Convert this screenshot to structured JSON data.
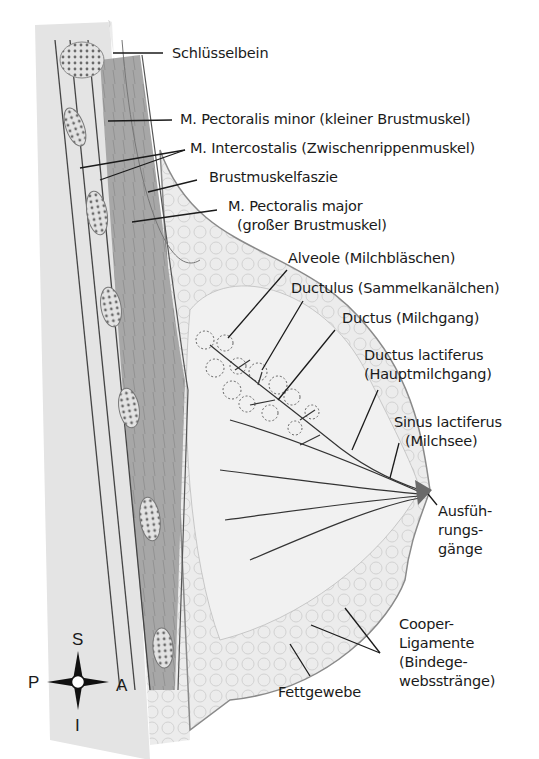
{
  "diagram": {
    "labels": {
      "schluesselbein": "Schlüsselbein",
      "pectoralis_minor": "M. Pectoralis minor (kleiner Brustmuskel)",
      "intercostalis": "M. Intercostalis (Zwischenrippenmuskel)",
      "brustmuskelfaszie": "Brustmuskelfaszie",
      "pectoralis_major_1": "M. Pectoralis major",
      "pectoralis_major_2": "(großer Brustmuskel)",
      "alveole": "Alveole (Milchbläschen)",
      "ductulus": "Ductulus (Sammelkanälchen)",
      "ductus": "Ductus (Milchgang)",
      "ductus_lactiferus_1": "Ductus lactiferus",
      "ductus_lactiferus_2": "(Hauptmilchgang)",
      "sinus_lactiferus_1": "Sinus lactiferus",
      "sinus_lactiferus_2": "(Milchsee)",
      "ausfuehrungsgaenge_1": "Ausfüh-",
      "ausfuehrungsgaenge_2": "rungs-",
      "ausfuehrungsgaenge_3": "gänge",
      "cooper_1": "Cooper-",
      "cooper_2": "Ligamente",
      "cooper_3": "(Bindege-",
      "cooper_4": "websstränge)",
      "fettgewebe": "Fettgewebe"
    },
    "compass": {
      "superior": "S",
      "inferior": "I",
      "posterior": "P",
      "anterior": "A"
    },
    "colors": {
      "tissue_fill": "#e9e9e9",
      "muscle_fill": "#a9a9a9",
      "rib_fill": "#d4d4d4",
      "line": "#2a2a2a",
      "text": "#1a1a1a"
    }
  }
}
